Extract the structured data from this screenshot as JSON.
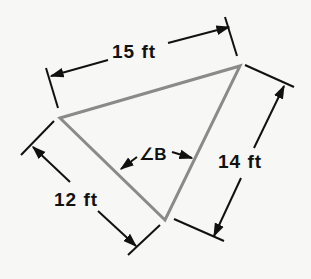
{
  "diagram": {
    "type": "triangle-dimension-drawing",
    "colors": {
      "background": "#f7f7f6",
      "triangle_stroke": "#8a8a8a",
      "dimension_stroke": "#111111",
      "text": "#111111"
    },
    "vertices": {
      "left": [
        60,
        118
      ],
      "top_right": [
        240,
        66
      ],
      "bottom": [
        165,
        220
      ]
    },
    "sides": [
      {
        "id": "top",
        "label": "15 ft",
        "between": [
          "left",
          "top_right"
        ]
      },
      {
        "id": "right",
        "label": "14 ft",
        "between": [
          "top_right",
          "bottom"
        ]
      },
      {
        "id": "left",
        "label": "12 ft",
        "between": [
          "left",
          "bottom"
        ]
      }
    ],
    "angle": {
      "label": "∠B",
      "at_vertex": "bottom"
    }
  },
  "labels": {
    "top_side": "15 ft",
    "right_side": "14 ft",
    "left_side": "12 ft",
    "angle": "∠B"
  }
}
